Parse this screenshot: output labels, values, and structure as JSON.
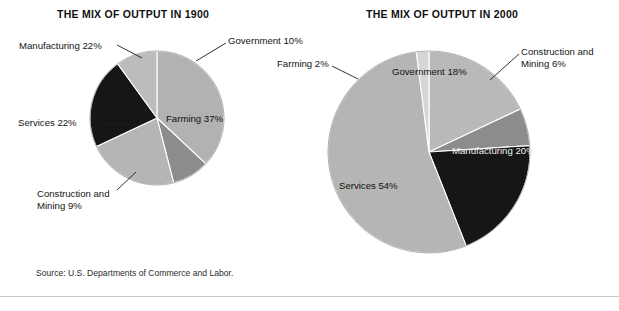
{
  "page": {
    "top_cut_text": "",
    "source_note": "Source: U.S. Departments of Commerce and Labor."
  },
  "charts": [
    {
      "id": "1900",
      "title": "THE MIX OF OUTPUT IN 1900",
      "labels": {
        "farming": "Farming 37%",
        "construction": "Construction and\nMining 9%",
        "services": "Services 22%",
        "manufacturing": "Manufacturing 22%",
        "government": "Government 10%"
      }
    },
    {
      "id": "2000",
      "title": "THE MIX OF OUTPUT IN 2000",
      "labels": {
        "farming": "Farming 2%",
        "government": "Government 18%",
        "construction": "Construction and\nMining 6%",
        "manufacturing": "Manufacturing 20%",
        "services": "Services 54%"
      }
    }
  ],
  "chart_data": [
    {
      "type": "pie",
      "title": "THE MIX OF OUTPUT IN 1900",
      "categories": [
        "Farming",
        "Construction and Mining",
        "Services",
        "Manufacturing",
        "Government"
      ],
      "values": [
        37,
        9,
        22,
        22,
        10
      ],
      "unit": "percent",
      "total": 100,
      "start_angle_deg": 0,
      "direction": "clockwise",
      "colors": [
        "#b2b2b2",
        "#8c8c8c",
        "#b5b5b5",
        "#161616",
        "#bcbcbc"
      ],
      "data_labels": [
        "Farming 37%",
        "Construction and Mining 9%",
        "Services 22%",
        "Manufacturing 22%",
        "Government 10%"
      ],
      "legend": "none",
      "grid": false
    },
    {
      "type": "pie",
      "title": "THE MIX OF OUTPUT IN 2000",
      "categories": [
        "Government",
        "Construction and Mining",
        "Manufacturing",
        "Services",
        "Farming"
      ],
      "values": [
        18,
        6,
        20,
        54,
        2
      ],
      "unit": "percent",
      "total": 100,
      "start_angle_deg": 0,
      "direction": "clockwise",
      "colors": [
        "#b9b9b9",
        "#8c8c8c",
        "#161616",
        "#b5b5b5",
        "#d6d6d6"
      ],
      "data_labels": [
        "Government 18%",
        "Construction and Mining 6%",
        "Manufacturing 20%",
        "Services 54%",
        "Farming 2%"
      ],
      "legend": "none",
      "grid": false
    }
  ],
  "geometry": {
    "pie_1900": {
      "cx": 157,
      "cy": 118,
      "r": 67
    },
    "pie_2000": {
      "cx": 429,
      "cy": 152,
      "r": 101
    }
  }
}
